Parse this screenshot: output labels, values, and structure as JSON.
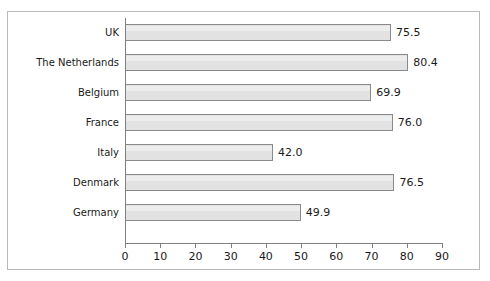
{
  "chart_data": {
    "type": "bar",
    "orientation": "horizontal",
    "title": "",
    "xlabel": "",
    "ylabel": "",
    "categories": [
      "UK",
      "The Netherlands",
      "Belgium",
      "France",
      "Italy",
      "Denmark",
      "Germany"
    ],
    "values": [
      75.5,
      80.4,
      69.9,
      76.0,
      42.0,
      76.5,
      49.9
    ],
    "value_labels": [
      "75.5",
      "80.4",
      "69.9",
      "76.0",
      "42.0",
      "76.5",
      "49.9"
    ],
    "xlim": [
      0,
      90
    ],
    "xticks": [
      0,
      10,
      20,
      30,
      40,
      50,
      60,
      70,
      80,
      90
    ],
    "xtick_labels": [
      "0",
      "10",
      "20",
      "30",
      "40",
      "50",
      "60",
      "70",
      "80",
      "90"
    ],
    "grid": false,
    "legend": null,
    "bar_fill_color": "#e2e2e2",
    "bar_border_color": "#8a8a8a",
    "frame_color": "#b9b9b9",
    "axis_color": "#808080",
    "text_color": "#1a1a1a"
  }
}
